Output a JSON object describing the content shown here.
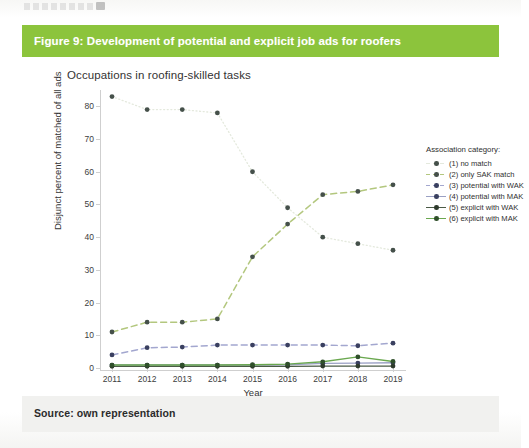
{
  "document": {
    "caption": "Figure 9: Development of potential and explicit job ads for roofers",
    "source": "Source: own representation",
    "caption_band_color": "#8cc43c",
    "footer_band_color": "#f1f1ef"
  },
  "chart_data": {
    "type": "line",
    "title": "Occupations in roofing-skilled tasks",
    "xlabel": "Year",
    "ylabel": "Disjunct percent of matched of all ads",
    "categories": [
      "2011",
      "2012",
      "2013",
      "2014",
      "2015",
      "2016",
      "2017",
      "2018",
      "2019"
    ],
    "x": [
      2011,
      2012,
      2013,
      2014,
      2015,
      2016,
      2017,
      2018,
      2019
    ],
    "ylim": [
      0,
      85
    ],
    "yticks": [
      0,
      10,
      20,
      30,
      40,
      50,
      60,
      70,
      80
    ],
    "grid": false,
    "legend_position": "right",
    "legend_title": "Association category:",
    "series": [
      {
        "name": "(1) no match",
        "key": "s1",
        "color": "#e4e9dd",
        "marker_color": "#45504a",
        "dash": "1,2.6",
        "width": 1.3,
        "values": [
          83,
          79,
          79,
          78,
          60,
          49,
          40,
          38,
          36
        ]
      },
      {
        "name": "(2) only SAK match",
        "key": "s2",
        "color": "#b3c77e",
        "marker_color": "#45504a",
        "dash": "6,4",
        "width": 1.5,
        "values": [
          11,
          14,
          14,
          15,
          34,
          44,
          53,
          54,
          56
        ]
      },
      {
        "name": "(3) potential with WAK",
        "key": "s3",
        "color": "#a3a7cf",
        "marker_color": "#3a4060",
        "dash": "6,4",
        "width": 1.5,
        "values": [
          4.0,
          6.2,
          6.4,
          7.0,
          7.0,
          7.0,
          7.0,
          6.8,
          7.6
        ]
      },
      {
        "name": "(4) potential with MAK",
        "key": "s4",
        "color": "#9aa0c4",
        "marker_color": "#3a4060",
        "dash": "0",
        "width": 1.4,
        "values": [
          0.9,
          0.9,
          0.9,
          0.9,
          0.9,
          1.0,
          1.4,
          1.5,
          1.6
        ]
      },
      {
        "name": "(5) explicit with WAK",
        "key": "s5",
        "color": "#4a5a46",
        "marker_color": "#2e3a2c",
        "dash": "0",
        "width": 1.3,
        "values": [
          0.5,
          0.5,
          0.5,
          0.5,
          0.5,
          0.5,
          0.6,
          0.6,
          0.6
        ]
      },
      {
        "name": "(6) explicit with MAK",
        "key": "s6",
        "color": "#6aa84f",
        "marker_color": "#2f4f2a",
        "dash": "0",
        "width": 1.4,
        "values": [
          0.9,
          0.9,
          0.9,
          0.9,
          1.0,
          1.2,
          1.9,
          3.4,
          2.0
        ]
      }
    ]
  }
}
